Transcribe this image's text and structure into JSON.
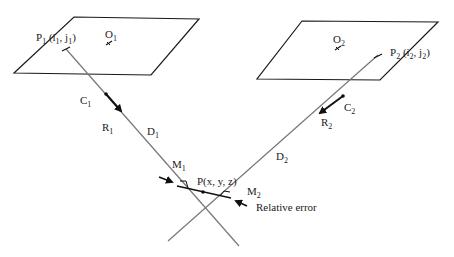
{
  "diagram": {
    "planes": [
      {
        "id": "image-plane-1",
        "center_label": "O",
        "center_sub": "1"
      },
      {
        "id": "image-plane-2",
        "center_label": "O",
        "center_sub": "2"
      }
    ],
    "points": {
      "p1": {
        "label": "P",
        "sub": "1",
        "coords_open": " (i",
        "coords_sub1": "1",
        "coords_mid": ", j",
        "coords_sub2": "1",
        "coords_close": ")"
      },
      "p2": {
        "label": "P",
        "sub": "2",
        "coords_open": " (i",
        "coords_sub1": "2",
        "coords_mid": ", j",
        "coords_sub2": "2",
        "coords_close": ")"
      },
      "p": {
        "label": "P(x, y, z)"
      },
      "m1": {
        "label": "M",
        "sub": "1"
      },
      "m2": {
        "label": "M",
        "sub": "2"
      }
    },
    "cameras": {
      "c1": {
        "label": "C",
        "sub": "1"
      },
      "c2": {
        "label": "C",
        "sub": "2"
      }
    },
    "rays": {
      "r1": {
        "label": "R",
        "sub": "1"
      },
      "r2": {
        "label": "R",
        "sub": "2"
      },
      "d1": {
        "label": "D",
        "sub": "1"
      },
      "d2": {
        "label": "D",
        "sub": "2"
      }
    },
    "annotation": {
      "relative_error": "Relative error"
    },
    "colors": {
      "plane_stroke": "#1a1a1a",
      "ray_stroke": "#777777",
      "text": "#222222",
      "segment": "#1a1a1a"
    }
  }
}
